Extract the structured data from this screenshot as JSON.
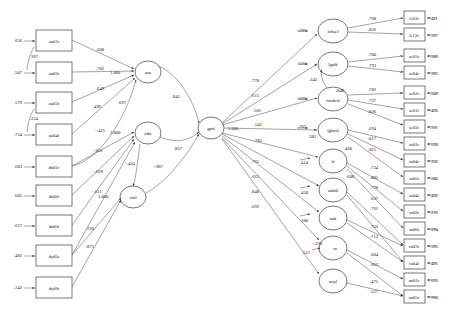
{
  "diagram": {
    "type": "sem-path-diagram"
  },
  "left_indicators": [
    {
      "label": "au01r",
      "error": ".656",
      "loading": ".608",
      "factor": "aut"
    },
    {
      "label": "au02r",
      "error": ".507",
      "loading": ".702",
      "factor": "aut"
    },
    {
      "label": "au03r",
      "error": ".579",
      "loading": ".649",
      "factor": "aut"
    },
    {
      "label": "au04r",
      "error": ".754",
      "loading": ".496",
      "factor": "aut"
    },
    {
      "label": "dn01r",
      "error": ".603",
      "loading": "-.425",
      "factor": "adu"
    },
    {
      "label": "dn02r",
      "error": ".605",
      "loading": "-.651",
      "factor": "adu"
    },
    {
      "label": "dn03r",
      "error": ".627",
      "loading": "-.629",
      "factor": "adu"
    },
    {
      "label": "dy05r",
      "error": ".482",
      "loading": "-.611",
      "factor": "adu"
    },
    {
      "label": "dy06r",
      "error": ".242",
      "loading": ".720",
      "factor": "vial"
    }
  ],
  "left_correlations": [
    {
      "value": ".367",
      "between": "au01r-au02r"
    },
    {
      "value": ".224",
      "between": "au03r-au04r"
    }
  ],
  "left_factors": [
    {
      "label": "aut",
      "variance": "1.000"
    },
    {
      "label": "adu",
      "variance": "1.000"
    },
    {
      "label": "vial",
      "variance": "1.000"
    }
  ],
  "left_extra_coefs": [
    {
      "value": ".667"
    },
    {
      "value": ".841"
    },
    {
      "value": ".857"
    },
    {
      "value": "-.424"
    },
    {
      "value": "-.907"
    },
    {
      "value": ".871"
    }
  ],
  "center_factor": {
    "label": "gmf",
    "variance": "1.000"
  },
  "right_factors": [
    {
      "label": "ichsel",
      "structural": ".397",
      "gmf_path": ".778",
      "indicators": [
        {
          "label": "le02r",
          "loading": ".768",
          "error": ".411"
        },
        {
          "label": "le12r",
          "loading": ".826",
          "error": ".327"
        }
      ]
    },
    {
      "label": "lgstk",
      "structural": ".521",
      "gmf_path": ".615",
      "indicators": [
        {
          "label": "se05r",
          "loading": ".700",
          "error": ".509"
        },
        {
          "label": "se04r",
          "loading": ".793",
          "error": ".365"
        }
      ]
    },
    {
      "label": "fordcsl",
      "structural": ".662",
      "gmf_path": ".581",
      "extra": ".343",
      "extra2": ".848",
      "indicators": [
        {
          "label": "se02r",
          "loading": ".782",
          "error": ".349"
        },
        {
          "label": "se01r",
          "loading": ".737",
          "error": ".456"
        },
        {
          "label": "se03r",
          "loading": ".836",
          "error": ".311"
        }
      ]
    },
    {
      "label": "lghnsl",
      "structural": ".707",
      "gmf_path": ".541",
      "extra": ".383",
      "indicators": [
        {
          "label": "so01r",
          "loading": ".694",
          "error": ".518"
        },
        {
          "label": "so04r",
          "loading": ".817",
          "error": ".332"
        },
        {
          "label": "so05r",
          "loading": ".811",
          "error": ".342"
        }
      ]
    },
    {
      "label": "ff",
      "structural": ".414",
      "gmf_path": ".785",
      "extra": ".460",
      "indicators": [
        {
          "label": "so04r",
          "loading": ".734",
          "error": ".432"
        },
        {
          "label": "so03r",
          "loading": ".885",
          "error": ".216"
        },
        {
          "label": "so06r",
          "loading": ".778",
          "error": ".394"
        }
      ]
    },
    {
      "label": "stabil",
      "structural": ".458",
      "gmf_path": ".765",
      "indicators": [
        {
          "label": "ru03r",
          "loading": ".637",
          "error": ".595"
        },
        {
          "label": "ru04r",
          "loading": ".761",
          "error": ".421"
        }
      ]
    },
    {
      "label": "ank",
      "structural": ".380",
      "gmf_path": ".665",
      "extra": ".608",
      "indicators": [
        {
          "label": "an03r",
          "loading": ".756",
          "error": ".428"
        },
        {
          "label": "an02r",
          "loading": ".713",
          "error": ".432"
        }
      ]
    },
    {
      "label": "ra",
      "structural": ".521",
      "gmf_path": ".848",
      "extra": "-.370",
      "indicators": [
        {
          "label": "an01r",
          "loading": ".604",
          "error": ".635"
        },
        {
          "label": "an05r",
          "loading": ".663",
          "error": ".960"
        }
      ]
    },
    {
      "label": "anyl",
      "structural": "",
      "gmf_path": ".692",
      "indicators": [
        {
          "label": "ay01r",
          "loading": ".475",
          "error": ".669"
        },
        {
          "label": "ay02r",
          "loading": ".527",
          "error": ".722"
        }
      ]
    }
  ],
  "colors": {
    "stroke": "#666666",
    "box_stroke": "#555555",
    "text": "#111111",
    "background": "#ffffff"
  }
}
